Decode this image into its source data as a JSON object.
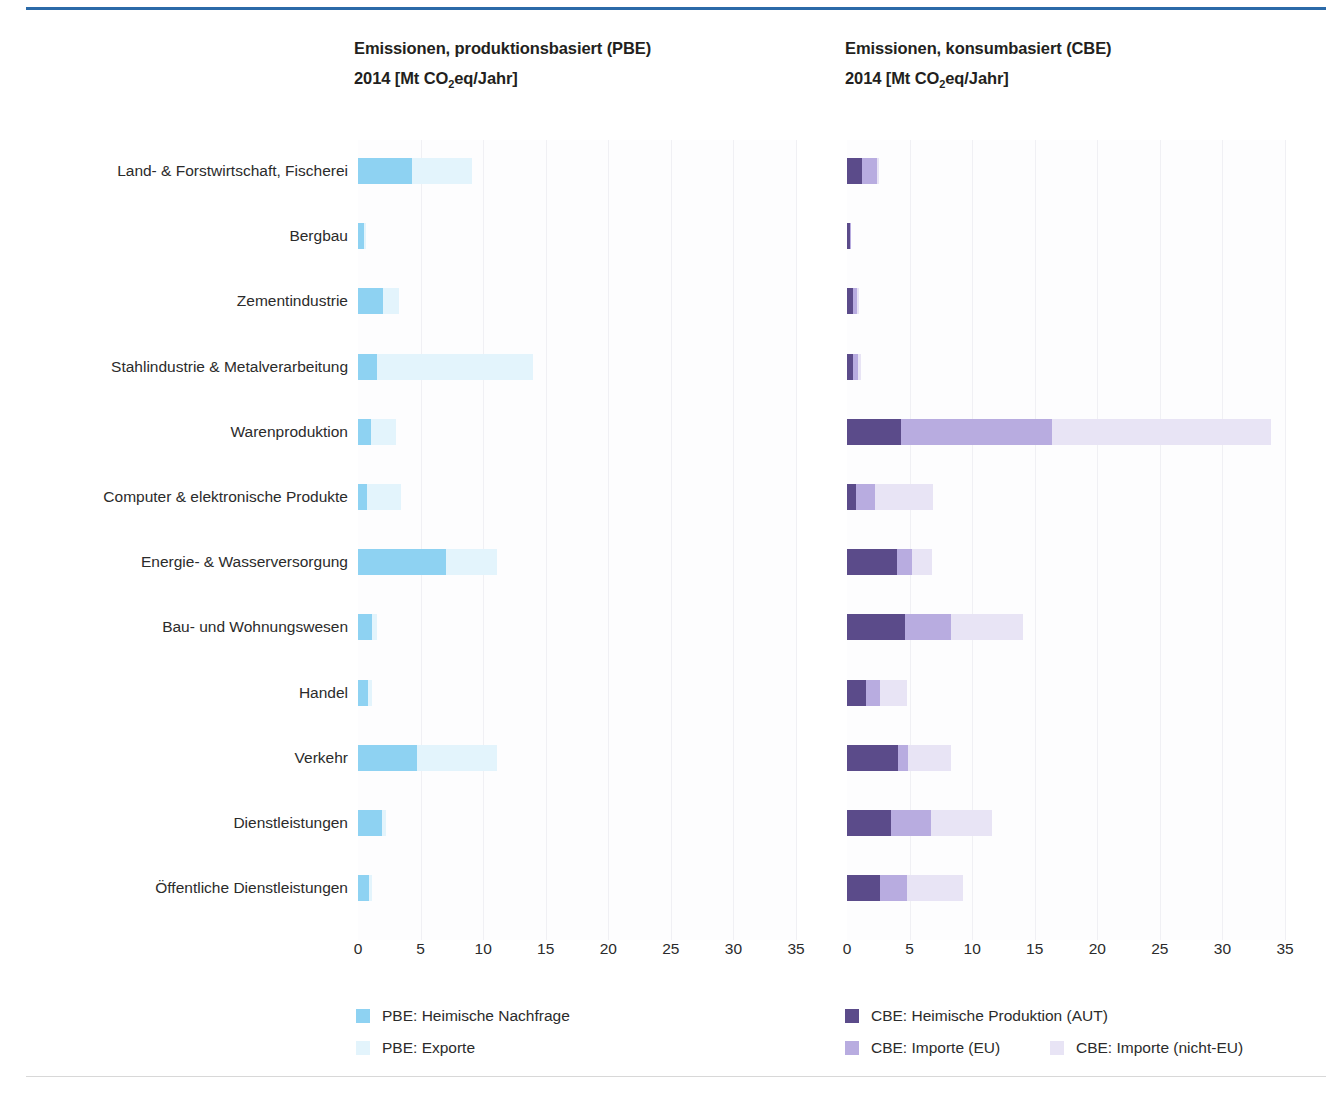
{
  "left_panel": {
    "title_line1": "Emissionen, produktionsbasiert  (PBE)",
    "title_line2_pre": "2014 [Mt CO",
    "title_line2_sub": "2",
    "title_line2_post": "eq/Jahr]"
  },
  "right_panel": {
    "title_line1": "Emissionen, konsumbasiert (CBE)",
    "title_line2_pre": "2014 [Mt CO",
    "title_line2_sub": "2",
    "title_line2_post": "eq/Jahr]"
  },
  "legend_left": [
    {
      "label": "PBE: Heimische Nachfrage",
      "color": "#8ed2f2"
    },
    {
      "label": "PBE: Exporte",
      "color": "#e3f4fc"
    }
  ],
  "legend_right": [
    {
      "label": "CBE: Heimische Produktion (AUT)",
      "color": "#5b4b8a"
    },
    {
      "label": "CBE: Importe (EU)",
      "color": "#b8ace0"
    },
    {
      "label": "CBE: Importe (nicht-EU)",
      "color": "#e8e4f5"
    }
  ],
  "colors": {
    "pbe_domestic": "#8ed2f2",
    "pbe_export": "#e3f4fc",
    "cbe_aut": "#5b4b8a",
    "cbe_eu": "#b8ace0",
    "cbe_noneu": "#e8e4f5",
    "rule": "#2b6aa8",
    "text": "#2b2b2b",
    "grid": "#f0f0f4"
  },
  "chart_data": {
    "type": "bar",
    "orientation": "horizontal",
    "stacked": true,
    "xlabel": "",
    "ylabel": "",
    "xlim": [
      0,
      35
    ],
    "xticks": [
      0,
      5,
      10,
      15,
      20,
      25,
      30,
      35
    ],
    "grid": true,
    "legend_position": "bottom",
    "units": "Mt CO2eq/Jahr",
    "year": 2014,
    "categories": [
      "Land- & Forstwirtschaft, Fischerei",
      "Bergbau",
      "Zementindustrie",
      "Stahlindustrie & Metalverarbeitung",
      "Warenproduktion",
      "Computer & elektronische Produkte",
      "Energie- & Wasserversorgung",
      "Bau- und Wohnungswesen",
      "Handel",
      "Verkehr",
      "Dienstleistungen",
      "Öffentliche Dienstleistungen"
    ],
    "panels": [
      {
        "name": "PBE",
        "title": "Emissionen, produktionsbasiert (PBE) 2014 [Mt CO2eq/Jahr]",
        "series": [
          {
            "name": "PBE: Heimische Nachfrage",
            "color": "#8ed2f2",
            "values": [
              4.3,
              0.5,
              2.0,
              1.5,
              1.0,
              0.7,
              7.0,
              1.1,
              0.8,
              4.7,
              1.9,
              0.9
            ]
          },
          {
            "name": "PBE: Exporte",
            "color": "#e3f4fc",
            "values": [
              4.8,
              0.1,
              1.3,
              12.5,
              2.0,
              2.7,
              4.1,
              0.4,
              0.3,
              6.4,
              0.3,
              0.2
            ]
          }
        ],
        "totals": [
          9.1,
          0.6,
          3.3,
          14.0,
          3.0,
          3.4,
          11.1,
          1.5,
          1.1,
          11.1,
          2.2,
          1.1
        ]
      },
      {
        "name": "CBE",
        "title": "Emissionen, konsumbasiert (CBE) 2014 [Mt CO2eq/Jahr]",
        "series": [
          {
            "name": "CBE: Heimische Produktion (AUT)",
            "color": "#5b4b8a",
            "values": [
              1.2,
              0.2,
              0.5,
              0.5,
              4.3,
              0.7,
              4.0,
              4.6,
              1.5,
              4.1,
              3.5,
              2.6
            ]
          },
          {
            "name": "CBE: Importe (EU)",
            "color": "#b8ace0",
            "values": [
              1.2,
              0.1,
              0.3,
              0.4,
              12.1,
              1.5,
              1.2,
              3.7,
              1.1,
              0.8,
              3.2,
              2.2
            ]
          },
          {
            "name": "CBE: Importe (nicht-EU)",
            "color": "#e8e4f5",
            "values": [
              0.1,
              0.0,
              0.1,
              0.2,
              17.5,
              4.7,
              1.6,
              5.8,
              2.2,
              3.4,
              4.9,
              4.5
            ]
          }
        ],
        "totals": [
          2.5,
          0.3,
          0.9,
          1.1,
          33.9,
          6.9,
          6.8,
          14.1,
          4.8,
          8.3,
          11.6,
          9.3
        ]
      }
    ]
  }
}
